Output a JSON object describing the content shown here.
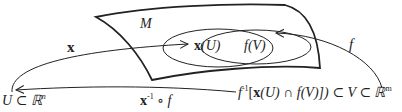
{
  "diagram": {
    "manifold_label": "M",
    "sets": {
      "left_ellipse_label_func": "x",
      "left_ellipse_label_arg": "(U)",
      "right_ellipse_label_func": "f",
      "right_ellipse_label_arg": "(V)"
    },
    "arrows": {
      "x_label": "x",
      "f_label": "f",
      "transition_func": "x",
      "transition_sup": "-1",
      "transition_rest": " ∘ f"
    },
    "domains": {
      "left": "U ⊂ ℝ",
      "left_sup": "n",
      "right_prefix": "f",
      "right_sup": "-1",
      "right_bracket_open": "[",
      "right_x": "x",
      "right_mid": "(U) ∩ f(V)]) ⊂ V ⊂ ℝ",
      "right_sup2": "m"
    },
    "colors": {
      "stroke": "#222222",
      "background": "#ffffff"
    }
  }
}
